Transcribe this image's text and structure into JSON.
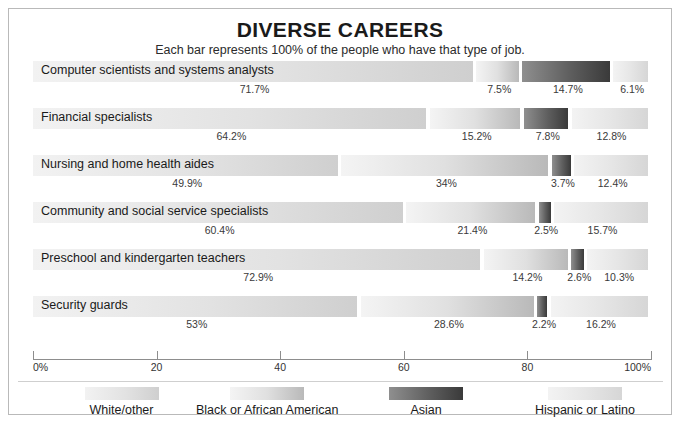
{
  "header": {
    "title": "DIVERSE CAREERS",
    "subtitle": "Each bar represents 100% of the people who have that type of job."
  },
  "axis": {
    "ticks": [
      "0%",
      "20",
      "40",
      "60",
      "80",
      "100%"
    ],
    "tick_values": [
      0,
      20,
      40,
      60,
      80,
      100
    ]
  },
  "legend": {
    "items": [
      {
        "label": "White/other",
        "color": "#e2e2e2"
      },
      {
        "label": "Black or African American",
        "color": "#e0e0e0"
      },
      {
        "label": "Asian",
        "color": "#5e5e5e"
      },
      {
        "label": "Hispanic or Latino",
        "color": "#e6e6e6"
      }
    ]
  },
  "chart_data": {
    "type": "bar",
    "title": "DIVERSE CAREERS",
    "subtitle": "Each bar represents 100% of the people who have that type of job.",
    "orientation": "horizontal",
    "stacked": true,
    "normalized_percent": true,
    "xlabel": "",
    "ylabel": "",
    "xlim": [
      0,
      100
    ],
    "grid": false,
    "legend_position": "bottom",
    "categories": [
      "Computer scientists and systems analysts",
      "Financial specialists",
      "Nursing and home health aides",
      "Community and social service specialists",
      "Preschool and kindergarten teachers",
      "Security guards"
    ],
    "series": [
      {
        "name": "White/other",
        "values": [
          71.7,
          64.2,
          49.9,
          60.4,
          72.9,
          53
        ]
      },
      {
        "name": "Black or African American",
        "values": [
          7.5,
          15.2,
          34,
          21.4,
          14.2,
          28.6
        ]
      },
      {
        "name": "Asian",
        "values": [
          14.7,
          7.8,
          3.7,
          2.5,
          2.6,
          2.2
        ]
      },
      {
        "name": "Hispanic or Latino",
        "values": [
          6.1,
          12.8,
          12.4,
          15.7,
          10.3,
          16.2
        ]
      }
    ],
    "data_labels": [
      [
        "71.7%",
        "7.5%",
        "14.7%",
        "6.1%"
      ],
      [
        "64.2%",
        "15.2%",
        "7.8%",
        "12.8%"
      ],
      [
        "49.9%",
        "34%",
        "3.7%",
        "12.4%"
      ],
      [
        "60.4%",
        "21.4%",
        "2.5%",
        "15.7%"
      ],
      [
        "72.9%",
        "14.2%",
        "2.6%",
        "10.3%"
      ],
      [
        "53%",
        "28.6%",
        "2.2%",
        "16.2%"
      ]
    ]
  }
}
